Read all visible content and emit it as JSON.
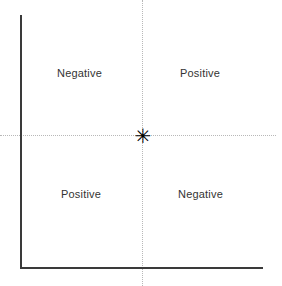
{
  "diagram": {
    "title": "",
    "background_color": "#ffffff",
    "axes": {
      "color": "#3a3a3a",
      "vertical_label": "",
      "horizontal_label": ""
    },
    "gridlines": {
      "color": "#b8b8b8",
      "style": "dotted"
    },
    "origin": {
      "marker_glyph": "✳",
      "marker_name": "six-pointed-star",
      "color": "#000000"
    },
    "quadrants": [
      {
        "position": "top-left",
        "label": "Negative"
      },
      {
        "position": "top-right",
        "label": "Positive"
      },
      {
        "position": "bottom-left",
        "label": "Positive"
      },
      {
        "position": "bottom-right",
        "label": "Negative"
      }
    ]
  }
}
